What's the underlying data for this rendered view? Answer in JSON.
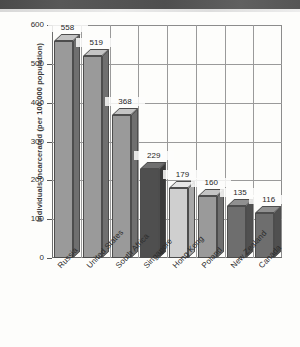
{
  "chart_data": {
    "type": "bar",
    "title": "",
    "subtitle": "",
    "xlabel": "",
    "ylabel": "Individuals Incarcerated (per 100,000 population)",
    "categories": [
      "Russia",
      "United States",
      "South Africa",
      "Singapore",
      "Hong Kong",
      "Poland",
      "New Zealand",
      "Canada"
    ],
    "values": [
      558,
      519,
      368,
      229,
      179,
      160,
      135,
      116
    ],
    "value_labels": [
      "558",
      "519",
      "368",
      "229",
      "179",
      "160",
      "135",
      "116"
    ],
    "ylim": [
      0,
      600
    ],
    "ytick_labels": [
      "0",
      "100",
      "200",
      "300",
      "400",
      "500",
      "600"
    ],
    "ytick_values": [
      0,
      100,
      200,
      300,
      400,
      500,
      600
    ],
    "grid": "horizontal-and-vertical",
    "legend": "none",
    "bar_style": "3d-extruded",
    "bar_colors": [
      "#9a9a9a",
      "#9a9a9a",
      "#9a9a9a",
      "#4f4f4f",
      "#cfcfcf",
      "#9a9a9a",
      "#6e6e6e",
      "#6e6e6e"
    ],
    "bar_top_colors": [
      "#c4c4c4",
      "#c4c4c4",
      "#c4c4c4",
      "#6f6f6f",
      "#e6e6e6",
      "#c4c4c4",
      "#909090",
      "#909090"
    ],
    "bar_side_colors": [
      "#6f6f6f",
      "#6f6f6f",
      "#6f6f6f",
      "#3a3a3a",
      "#a8a8a8",
      "#6f6f6f",
      "#505050",
      "#505050"
    ],
    "axis_color": "#6d6d6d",
    "grid_color": "#9a9a9a",
    "background_color": "#fdfdfb"
  }
}
